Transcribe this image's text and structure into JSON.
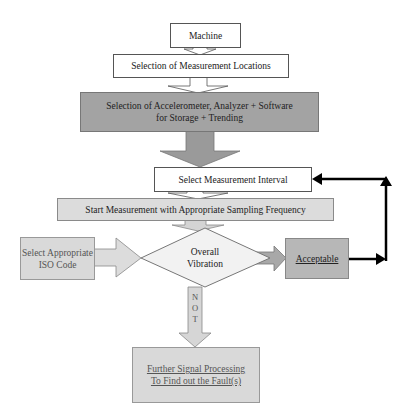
{
  "diagram": {
    "type": "flowchart",
    "nodes": {
      "machine": {
        "label": "Machine"
      },
      "locations": {
        "label": "Selection of Measurement Locations"
      },
      "equipment": {
        "line1": "Selection of Accelerometer, Analyzer + Software",
        "line2": "for Storage + Trending"
      },
      "interval": {
        "label": "Select Measurement Interval"
      },
      "start": {
        "label": "Start Measurement with Appropriate Sampling Frequency"
      },
      "iso": {
        "line1": "Select Appropriate",
        "line2": "ISO Code"
      },
      "decision": {
        "line1": "Overall",
        "line2": "Vibration"
      },
      "acceptable": {
        "label": "Acceptable"
      },
      "further": {
        "line1": "Further Signal Processing",
        "line2": "To Find out the Fault(s)"
      }
    },
    "edges": {
      "not_label": [
        "N",
        "O",
        "T"
      ]
    },
    "colors": {
      "white_box": "#ffffff",
      "dark_box": "#a3a3a3",
      "light_box": "#dcdcdc",
      "arrow_fill": "#c8c8c8",
      "feedback_arrow": "#000000"
    }
  }
}
